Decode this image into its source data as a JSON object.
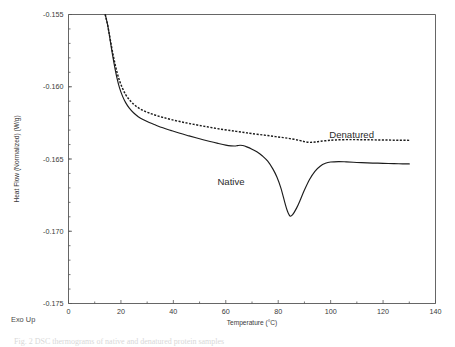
{
  "figure": {
    "exo_note": "Exo Up",
    "caption": "Fig. 2  DSC thermograms of native and denatured protein samples"
  },
  "chart_data": {
    "type": "line",
    "title": "",
    "xlabel": "Temperature  (°C)",
    "ylabel": "Heat Flow (Normalized)  (W/g)",
    "xlim": [
      0,
      140
    ],
    "ylim": [
      -0.175,
      -0.155
    ],
    "xticks": [
      0,
      20,
      40,
      60,
      80,
      100,
      120,
      140
    ],
    "xticklabels": [
      "0",
      "20",
      "40",
      "60",
      "80",
      "100",
      "120",
      "140"
    ],
    "yticks": [
      -0.155,
      -0.16,
      -0.165,
      -0.17,
      -0.175
    ],
    "yticklabels": [
      "-0.155",
      "-0.160",
      "-0.165",
      "-0.170",
      "-0.175"
    ],
    "grid": false,
    "legend_position": "inline-annotation",
    "series": [
      {
        "name": "Denatured",
        "style": "dashed",
        "label_x": 108,
        "label_y": -0.16355,
        "x": [
          14.0,
          14.4,
          14.9,
          15.4,
          16.0,
          16.8,
          17.6,
          18.5,
          19.5,
          20.6,
          21.8,
          23.2,
          24.8,
          26.6,
          28.6,
          30.8,
          33.2,
          36.0,
          39.0,
          42.5,
          46.0,
          50.0,
          54.0,
          58.0,
          62.0,
          64.0,
          66.0,
          68.0,
          70.0,
          73.0,
          76.0,
          79.0,
          82.0,
          85.0,
          88.0,
          90.0,
          92.0,
          94.0,
          96.0,
          99.0,
          102.0,
          106.0,
          110.0,
          114.0,
          118.0,
          122.0,
          126.0,
          130.0
        ],
        "y": [
          -0.155,
          -0.1553,
          -0.1557,
          -0.1562,
          -0.1568,
          -0.1576,
          -0.1583,
          -0.159,
          -0.1596,
          -0.1601,
          -0.16055,
          -0.1609,
          -0.1612,
          -0.16145,
          -0.16165,
          -0.16182,
          -0.16197,
          -0.16212,
          -0.16226,
          -0.16241,
          -0.16254,
          -0.16268,
          -0.16281,
          -0.16293,
          -0.16304,
          -0.16309,
          -0.16314,
          -0.16319,
          -0.16324,
          -0.16331,
          -0.16338,
          -0.16345,
          -0.16352,
          -0.1636,
          -0.16371,
          -0.1638,
          -0.16385,
          -0.16383,
          -0.16378,
          -0.16372,
          -0.16368,
          -0.16366,
          -0.16366,
          -0.16367,
          -0.16368,
          -0.16369,
          -0.1637,
          -0.16371
        ]
      },
      {
        "name": "Native",
        "style": "solid",
        "label_x": 62,
        "label_y": -0.16682,
        "x": [
          14.0,
          14.4,
          14.9,
          15.4,
          16.0,
          16.8,
          17.6,
          18.5,
          19.5,
          20.6,
          21.8,
          23.2,
          24.8,
          26.6,
          28.6,
          30.8,
          33.2,
          36.0,
          39.0,
          42.5,
          46.0,
          50.0,
          54.0,
          57.0,
          60.0,
          62.0,
          63.5,
          64.5,
          65.5,
          66.5,
          68.0,
          70.0,
          72.0,
          74.0,
          76.0,
          78.0,
          79.5,
          81.0,
          82.5,
          83.5,
          84.5,
          85.5,
          87.0,
          88.5,
          90.0,
          92.0,
          94.0,
          96.0,
          98.0,
          100.0,
          103.0,
          106.0,
          110.0,
          114.0,
          118.0,
          122.0,
          126.0,
          130.0
        ],
        "y": [
          -0.155,
          -0.1553,
          -0.1557,
          -0.1562,
          -0.1569,
          -0.1578,
          -0.1586,
          -0.1594,
          -0.1601,
          -0.16065,
          -0.1611,
          -0.16148,
          -0.1618,
          -0.16207,
          -0.16229,
          -0.16248,
          -0.16265,
          -0.16284,
          -0.16302,
          -0.16322,
          -0.1634,
          -0.1636,
          -0.16379,
          -0.16392,
          -0.16404,
          -0.16409,
          -0.1641,
          -0.16407,
          -0.16405,
          -0.16407,
          -0.16416,
          -0.16432,
          -0.16452,
          -0.16479,
          -0.16515,
          -0.1657,
          -0.16625,
          -0.167,
          -0.168,
          -0.1686,
          -0.16895,
          -0.16885,
          -0.1684,
          -0.1678,
          -0.16715,
          -0.1664,
          -0.16585,
          -0.1655,
          -0.1653,
          -0.16521,
          -0.16518,
          -0.1652,
          -0.16524,
          -0.16527,
          -0.16529,
          -0.16531,
          -0.16533,
          -0.16534
        ]
      }
    ]
  }
}
